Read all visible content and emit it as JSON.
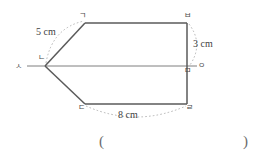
{
  "figure": {
    "name": "pentagon-with-symmetry-axis",
    "stroke_color": "#5a5a5a",
    "dotted_color": "#9a9a9a",
    "vertices": [
      {
        "key": "g",
        "label": "ㄱ",
        "name": "vertex-label-giyeok",
        "x": 85,
        "y": 23
      },
      {
        "key": "b",
        "label": "ㅂ",
        "name": "vertex-label-bieup",
        "x": 187,
        "y": 23
      },
      {
        "key": "n",
        "label": "ㄴ",
        "name": "vertex-label-nieun",
        "x": 45,
        "y": 66
      },
      {
        "key": "m",
        "label": "ㅁ",
        "name": "vertex-label-mieum",
        "x": 187,
        "y": 66
      },
      {
        "key": "d",
        "label": "ㄷ",
        "name": "vertex-label-digeut",
        "x": 85,
        "y": 104
      },
      {
        "key": "r",
        "label": "ㄹ",
        "name": "vertex-label-rieul",
        "x": 187,
        "y": 104
      },
      {
        "key": "s",
        "label": "ㅅ",
        "name": "axis-label-siot",
        "x": 20,
        "y": 66
      },
      {
        "key": "o",
        "label": "ㅇ",
        "name": "axis-label-ieung",
        "x": 200,
        "y": 66
      }
    ],
    "measurements": [
      {
        "key": "side_gn",
        "label": "5 cm",
        "name": "measure-label-5cm"
      },
      {
        "key": "side_bm",
        "label": "3 cm",
        "name": "measure-label-3cm"
      },
      {
        "key": "side_dr",
        "label": "8 cm",
        "name": "measure-label-8cm"
      }
    ]
  },
  "answer": {
    "open_paren": "(",
    "close_paren": ")",
    "value": ""
  }
}
